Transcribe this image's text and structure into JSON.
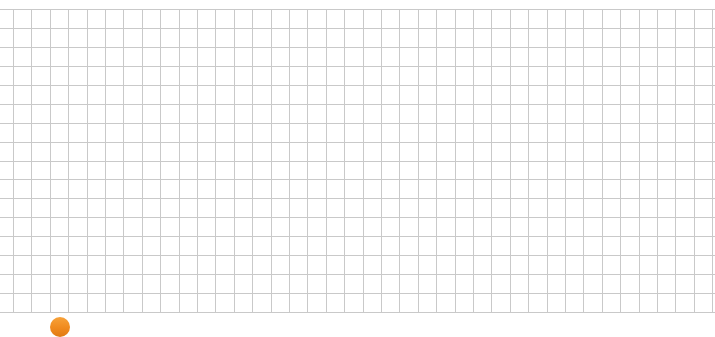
{
  "canvas": {
    "width": 715,
    "height": 328,
    "background": "#ffffff"
  },
  "grid": {
    "line_color": "#c9c9c9",
    "x_start": 13,
    "x_end": 712,
    "x_step": 18.4,
    "y_start": 9,
    "y_end": 312,
    "y_step": 18.94
  },
  "badge": {
    "icon": "orange-circle-icon",
    "color": "#f08a1e"
  }
}
